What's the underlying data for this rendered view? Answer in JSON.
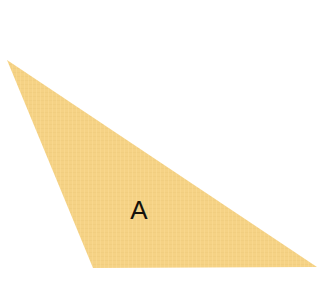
{
  "canvas": {
    "width": 332,
    "height": 306,
    "background_color": "#FFFFFF"
  },
  "figure": {
    "name": "triangle-a",
    "kind": "triangle",
    "label": "A",
    "label_position": {
      "x": 139,
      "y": 212
    },
    "fill_color": "#F5D285",
    "fill_color_shade": "#EFC978",
    "stroke_color": "none",
    "texture": "woven-fabric",
    "vertices": [
      {
        "name": "apex-left",
        "x": 7,
        "y": 60
      },
      {
        "name": "bottom-left",
        "x": 93,
        "y": 268
      },
      {
        "name": "right",
        "x": 317,
        "y": 267
      }
    ],
    "points_string": "7,60 93,268 317,267"
  },
  "chart_data": {
    "type": "scatter",
    "title": "",
    "xlabel": "",
    "ylabel": "",
    "shapes": [
      {
        "label": "A",
        "type": "triangle",
        "fill": "#F5D285",
        "vertices": [
          [
            7,
            60
          ],
          [
            93,
            268
          ],
          [
            317,
            267
          ]
        ]
      }
    ]
  }
}
